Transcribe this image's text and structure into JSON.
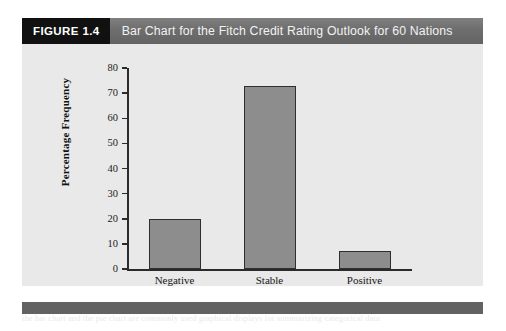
{
  "figure": {
    "badge": "FIGURE 1.4",
    "title": "Bar Chart for the Fitch Credit Rating Outlook for 60 Nations",
    "badge_bg": "#111111",
    "caption_bg": "#6e6e6e",
    "panel_bg": "#e9e9e9",
    "footer_bg": "#626262"
  },
  "chart_data": {
    "type": "bar",
    "title": "Bar Chart for the Fitch Credit Rating Outlook for 60 Nations",
    "categories": [
      "Negative",
      "Stable",
      "Positive"
    ],
    "values": [
      20,
      73,
      7
    ],
    "xlabel": "Fitch Outlook",
    "ylabel": "Percentage Frequency",
    "ylim": [
      0,
      80
    ],
    "ytick_step": 10,
    "yticks": [
      0,
      10,
      20,
      30,
      40,
      50,
      60,
      70,
      80
    ],
    "ytick_labels": [
      "0",
      "10",
      "20",
      "30",
      "40",
      "50",
      "60",
      "70",
      "80"
    ],
    "grid": false,
    "legend": false,
    "bar_fill": "#8d8d8d",
    "bar_edge": "#2f2f2f"
  },
  "bleed": {
    "left_column": "seat belt use has been shown to reduce the risk of fatal injury to front seat passengers by forty five percent and the risk of moderate to critical injury by fifty percent among drivers and front seat passengers in the same vehicle class during recent survey years reported by the agency.",
    "right_column": "a relative frequency distribution gives a tabular summary of data showing the relative frequency for each class and a percent frequency distribution summarizes the percent frequency of the data for each class as shown in the accompanying tables and figures of this section.",
    "footer_line": "the bar chart and the pie chart are commonly used graphical displays for summarizing categorical data"
  }
}
